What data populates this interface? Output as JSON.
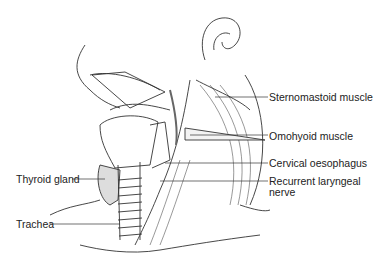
{
  "figure": {
    "labels": {
      "sternomastoid": "Sternomastoid muscle",
      "omohyoid": "Omohyoid muscle",
      "cervical_oesophagus": "Cervical oesophagus",
      "recurrent_laryngeal": "Recurrent laryngeal nerve",
      "thyroid": "Thyroid gland",
      "trachea": "Trachea"
    },
    "colors": {
      "line": "#333333",
      "shade": "#9a9a9a",
      "background": "#ffffff"
    }
  }
}
